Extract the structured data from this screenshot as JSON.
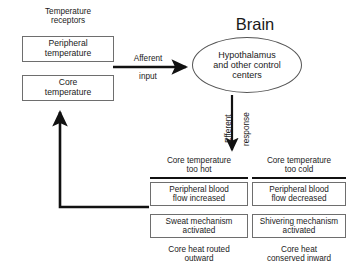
{
  "diagram": {
    "background": "#ffffff",
    "ink": "#111111",
    "box_border": "#6e6e6e"
  },
  "receptors": {
    "heading": "Temperature\nreceptors",
    "boxes": [
      {
        "label": "Peripheral\ntemperature"
      },
      {
        "label": "Core\ntemperature"
      }
    ]
  },
  "afferent": {
    "line1": "Afferent",
    "line2": "input"
  },
  "brain": {
    "title": "Brain",
    "center_label": "Hypothalamus\nand other control\ncenters"
  },
  "efferent": {
    "word1": "Efferent",
    "word2": "response"
  },
  "branches": [
    {
      "heading": "Core temperature\ntoo hot",
      "boxes": [
        {
          "label": "Peripheral blood\nflow increased"
        },
        {
          "label": "Sweat mechanism\nactivated"
        }
      ],
      "caption": "Core heat routed\noutward"
    },
    {
      "heading": "Core temperature\ntoo cold",
      "boxes": [
        {
          "label": "Peripheral blood\nflow decreased"
        },
        {
          "label": "Shivering mechanism\nactivated"
        }
      ],
      "caption": "Core heat\nconserved inward"
    }
  ],
  "feedback": {
    "name": "negative-feedback-return-path"
  }
}
